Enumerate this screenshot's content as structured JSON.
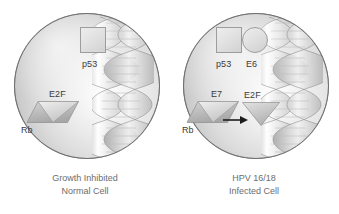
{
  "figure": {
    "background": "#ffffff",
    "label_color": "#3b3b3b",
    "caption_color": "#6d6d6d"
  },
  "panels": [
    {
      "id": "normal-cell",
      "caption_line1": "Growth Inhibited",
      "caption_line2": "Normal Cell",
      "molecules": [
        {
          "id": "p53",
          "label": "p53",
          "shape": "square"
        },
        {
          "id": "e2f",
          "label": "E2F",
          "shape": "triangle"
        },
        {
          "id": "rb",
          "label": "Rb",
          "shape": "parallelogram"
        }
      ],
      "dna": {
        "label": "dna-double-helix",
        "turns": 4
      },
      "arrow": null
    },
    {
      "id": "hpv-infected-cell",
      "caption_line1": "HPV 16/18",
      "caption_line2": "Infected Cell",
      "molecules": [
        {
          "id": "p53",
          "label": "p53",
          "shape": "square"
        },
        {
          "id": "e6",
          "label": "E6",
          "shape": "circle"
        },
        {
          "id": "e7",
          "label": "E7",
          "shape": "triangle"
        },
        {
          "id": "rb",
          "label": "Rb",
          "shape": "parallelogram"
        },
        {
          "id": "e2f",
          "label": "E2F",
          "shape": "triangle"
        }
      ],
      "dna": {
        "label": "dna-double-helix",
        "turns": 4
      },
      "arrow": {
        "direction": "right",
        "meaning": "E2F released"
      }
    }
  ]
}
